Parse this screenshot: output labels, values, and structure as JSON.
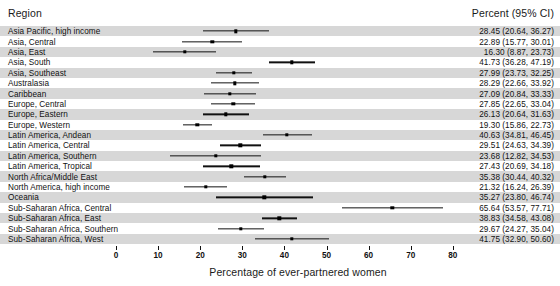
{
  "header": {
    "region_label": "Region",
    "percent_label": "Percent (95% CI)"
  },
  "axis": {
    "title": "Percentage of ever-partnered women",
    "ticks": [
      0,
      10,
      20,
      30,
      40,
      50,
      60,
      70,
      80
    ]
  },
  "chart_data": {
    "type": "scatter",
    "subtype": "forest-plot",
    "title": "",
    "xlabel": "Percentage of ever-partnered women",
    "ylabel": "Region",
    "xlim": [
      0,
      80
    ],
    "xticks": [
      0,
      10,
      20,
      30,
      40,
      50,
      60,
      70,
      80
    ],
    "grid": false,
    "legend": "none",
    "columns": [
      "Region",
      "Percent (95% CI)"
    ],
    "categories": [
      "Asia Pacific, high income",
      "Asia, Central",
      "Asia, East",
      "Asia, South",
      "Asia, Southeast",
      "Australasia",
      "Caribbean",
      "Europe, Central",
      "Europe, Eastern",
      "Europe, Western",
      "Latin America, Andean",
      "Latin America, Central",
      "Latin America, Southern",
      "Latin America, Tropical",
      "North Africa/Middle East",
      "North America, high income",
      "Oceania",
      "Sub-Saharan Africa, Central",
      "Sub-Saharan Africa, East",
      "Sub-Saharan Africa, Southern",
      "Sub-Saharan Africa, West"
    ],
    "values": [
      28.45,
      22.89,
      16.3,
      41.73,
      27.99,
      28.29,
      27.09,
      27.85,
      26.13,
      19.3,
      40.63,
      29.51,
      23.68,
      27.43,
      35.38,
      21.32,
      35.27,
      65.64,
      38.83,
      29.67,
      41.75
    ],
    "ci_low": [
      20.64,
      15.77,
      8.87,
      36.28,
      23.73,
      22.66,
      20.84,
      22.65,
      20.64,
      15.86,
      34.81,
      24.63,
      12.82,
      20.69,
      30.44,
      16.24,
      23.8,
      53.57,
      34.58,
      24.27,
      32.9
    ],
    "ci_high": [
      36.27,
      30.01,
      23.73,
      47.19,
      32.25,
      33.92,
      33.33,
      33.04,
      31.63,
      22.73,
      46.45,
      34.39,
      34.53,
      34.18,
      40.32,
      26.39,
      46.74,
      77.71,
      43.08,
      35.04,
      50.6
    ],
    "labels": [
      "28.45 (20.64, 36.27)",
      "22.89 (15.77, 30.01)",
      "16.30 (8.87, 23.73)",
      "41.73 (36.28, 47.19)",
      "27.99 (23.73, 32.25)",
      "28.29 (22.66, 33.92)",
      "27.09 (20.84, 33.33)",
      "27.85 (22.65, 33.04)",
      "26.13 (20.64, 31.63)",
      "19.30 (15.86, 22.73)",
      "40.63 (34.81, 46.45)",
      "29.51 (24.63, 34.39)",
      "23.68 (12.82, 34.53)",
      "27.43 (20.69, 34.18)",
      "35.38 (30.44, 40.32)",
      "21.32 (16.24, 26.39)",
      "35.27 (23.80, 46.74)",
      "65.64 (53.57, 77.71)",
      "38.83 (34.58, 43.08)",
      "29.67 (24.27, 35.04)",
      "41.75 (32.90, 50.60)"
    ]
  },
  "colors": {
    "band": "#d7d7d7",
    "marker": "#000000",
    "line": "#111111",
    "background": "#ffffff"
  }
}
